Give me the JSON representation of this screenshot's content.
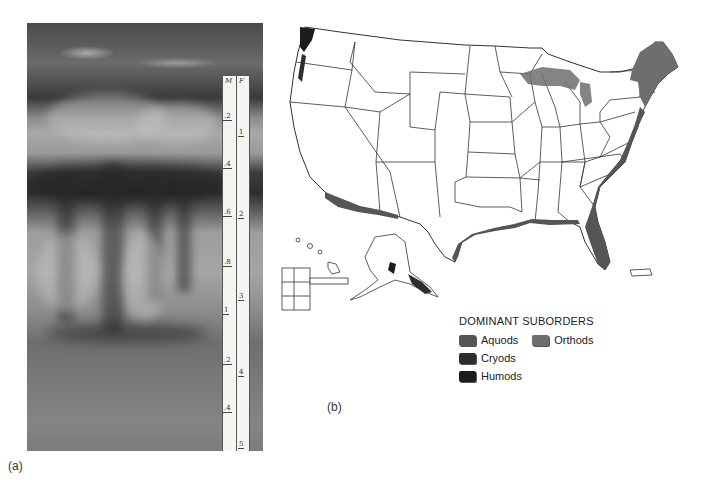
{
  "figure": {
    "panel_a": {
      "caption": "(a)",
      "description": "Soil profile photograph (Spodosol) with measuring ruler",
      "ruler": {
        "left_header": "M",
        "right_header": "F",
        "left_scale": [
          ".2",
          ".4",
          ".6",
          ".8",
          "1",
          ".2",
          ".4"
        ],
        "right_scale": [
          "1",
          "2",
          "3",
          "4",
          "5"
        ]
      }
    },
    "panel_b": {
      "caption": "(b)",
      "description": "Map of the United States showing distribution of Spodosol suborders"
    }
  },
  "legend": {
    "title": "DOMINANT SUBORDERS",
    "items": [
      {
        "label": "Aquods",
        "color": "#555555"
      },
      {
        "label": "Orthods",
        "color": "#6e6e6e"
      },
      {
        "label": "Cryods",
        "color": "#2e2e2e"
      },
      {
        "label": "Humods",
        "color": "#1c1c1c"
      }
    ]
  },
  "colors": {
    "state_outline": "#333333",
    "land_fill": "#ffffff",
    "aquods_fill": "#555555",
    "orthods_fill": "#6e6e6e",
    "cryods_fill": "#2e2e2e",
    "humods_fill": "#1c1c1c"
  }
}
